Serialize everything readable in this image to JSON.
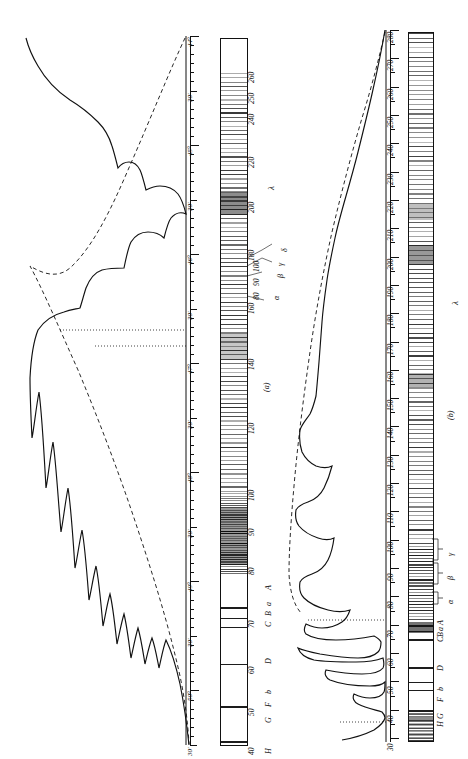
{
  "figure": {
    "caption_a": "(a)",
    "caption_b": "(b)",
    "lambda_symbol_a": "λ",
    "lambda_symbol_b": "λ"
  },
  "panel_a": {
    "name": "panel-a",
    "angular_scale": {
      "unit_major": "°",
      "unit_minor": "'",
      "labels": [
        "44°",
        "30'",
        "45°",
        "30'",
        "46°",
        "30'",
        "47°",
        "30'",
        "48°",
        "30'",
        "49°",
        "30'",
        "50°",
        "30'"
      ],
      "start_deg": 44.0,
      "end_deg": 50.5,
      "minor_tick_interval_min": 5
    },
    "wavelength_scale": {
      "axis_label": "λ",
      "ticks": [
        40,
        50,
        60,
        70,
        80,
        90,
        100,
        120,
        140,
        160,
        180,
        200,
        220,
        240,
        250,
        260
      ]
    },
    "fraunhofer_labels": [
      "H",
      "G",
      "F",
      "b",
      "D",
      "C",
      "B",
      "a",
      "A"
    ],
    "series_labels": [
      "α",
      "β",
      "γ",
      "δ"
    ],
    "lead_values": [
      "80",
      "90",
      "100"
    ]
  },
  "panel_b": {
    "name": "panel-b",
    "wavelength_scale": {
      "axis_label": "λ",
      "ticks": [
        30,
        40,
        50,
        60,
        70,
        80,
        90,
        100,
        110,
        120,
        130,
        140,
        150,
        160,
        170,
        180,
        190,
        200,
        210,
        220,
        230,
        240,
        250,
        260,
        270,
        280
      ],
      "min": 30,
      "max": 280
    },
    "fraunhofer_labels": [
      "H",
      "G",
      "F",
      "b",
      "D",
      "C",
      "B",
      "a",
      "A"
    ],
    "series_labels": [
      "α",
      "β",
      "γ"
    ]
  },
  "chart_data": {
    "type": "line",
    "title": "",
    "xlabel": "λ",
    "ylabel": "Energy",
    "charts": [
      {
        "id": "a",
        "caption": "(a)",
        "xlabel": "λ",
        "xlim": [
          40,
          260
        ],
        "secondary_axis": {
          "name": "deviation angle",
          "min": "44°",
          "max": "50°30'"
        },
        "series": [
          {
            "name": "observed energy curve",
            "style": "solid",
            "x": [
              260,
              250,
              240,
              230,
              220,
              210,
              205,
              200,
              196,
              192,
              188,
              184,
              180,
              176,
              172,
              168,
              164,
              160,
              156,
              152,
              148,
              144,
              140,
              136,
              132,
              128,
              124,
              120,
              116,
              112,
              108,
              104,
              100,
              98,
              96,
              94,
              92,
              90,
              88,
              86,
              84,
              82,
              80,
              78,
              76,
              74,
              72,
              70,
              68,
              66,
              64,
              62,
              60,
              58,
              56,
              54,
              52,
              50,
              48,
              46,
              44,
              42,
              40
            ],
            "y": [
              0.01,
              0.03,
              0.06,
              0.1,
              0.14,
              0.19,
              0.22,
              0.26,
              0.3,
              0.33,
              0.36,
              0.4,
              0.43,
              0.47,
              0.5,
              0.48,
              0.52,
              0.57,
              0.6,
              0.58,
              0.62,
              0.66,
              0.7,
              0.67,
              0.64,
              0.68,
              0.74,
              0.62,
              0.58,
              0.86,
              0.9,
              0.66,
              0.72,
              0.95,
              0.75,
              0.6,
              0.8,
              1.0,
              0.64,
              0.55,
              0.7,
              0.88,
              0.52,
              0.45,
              0.62,
              0.75,
              0.4,
              0.35,
              0.48,
              0.3,
              0.26,
              0.34,
              0.22,
              0.18,
              0.24,
              0.15,
              0.12,
              0.16,
              0.1,
              0.08,
              0.11,
              0.06,
              0.04
            ]
          },
          {
            "name": "envelope (blackbody / ideal)",
            "style": "dashed",
            "x": [
              260,
              240,
              220,
              200,
              180,
              160,
              140,
              120,
              110,
              100,
              95,
              90,
              85,
              80,
              75,
              70,
              65,
              60,
              55,
              50,
              45,
              40
            ],
            "y": [
              0.02,
              0.08,
              0.17,
              0.28,
              0.42,
              0.56,
              0.7,
              0.84,
              0.9,
              0.96,
              0.99,
              1.0,
              0.96,
              0.89,
              0.8,
              0.7,
              0.59,
              0.48,
              0.38,
              0.29,
              0.2,
              0.12
            ]
          }
        ]
      },
      {
        "id": "b",
        "caption": "(b)",
        "xlabel": "λ",
        "xlim": [
          30,
          280
        ],
        "series": [
          {
            "name": "observed energy curve",
            "style": "solid",
            "x": [
              280,
              275,
              270,
              265,
              260,
              255,
              250,
              245,
              240,
              235,
              230,
              225,
              220,
              215,
              210,
              205,
              200,
              195,
              190,
              185,
              180,
              175,
              170,
              165,
              160,
              155,
              150,
              145,
              140,
              136,
              132,
              130,
              128,
              126,
              124,
              122,
              120,
              118,
              116,
              114,
              112,
              110,
              108,
              106,
              104,
              102,
              100,
              98,
              96,
              94,
              92,
              90,
              88,
              86,
              84,
              82,
              80,
              78,
              76,
              74,
              72,
              70,
              68,
              66,
              64,
              62,
              60,
              55,
              50,
              45,
              42,
              40,
              38,
              35,
              32,
              30
            ],
            "y": [
              0.0,
              0.1,
              0.22,
              0.3,
              0.37,
              0.43,
              0.48,
              0.52,
              0.56,
              0.6,
              0.63,
              0.66,
              0.69,
              0.71,
              0.73,
              0.74,
              0.76,
              0.77,
              0.78,
              0.79,
              0.8,
              0.81,
              0.82,
              0.83,
              0.84,
              0.85,
              0.86,
              0.88,
              0.9,
              0.95,
              0.93,
              0.8,
              0.82,
              0.86,
              0.84,
              0.81,
              0.79,
              0.83,
              0.86,
              0.9,
              0.96,
              0.72,
              0.7,
              0.74,
              0.78,
              0.7,
              0.66,
              0.76,
              0.88,
              0.8,
              0.7,
              0.62,
              0.58,
              0.56,
              0.54,
              0.52,
              0.5,
              0.3,
              0.1,
              0.06,
              0.04,
              0.44,
              0.03,
              0.02,
              0.02,
              0.02,
              0.02,
              0.02,
              0.02,
              0.02,
              0.05,
              0.12,
              0.3,
              0.55,
              0.75,
              0.86
            ]
          },
          {
            "name": "envelope (blackbody / ideal)",
            "style": "dashed",
            "x": [
              280,
              260,
              240,
              220,
              200,
              180,
              160,
              150,
              140,
              130,
              120,
              110,
              105,
              100,
              95,
              90,
              85,
              80
            ],
            "y": [
              0.0,
              0.34,
              0.52,
              0.66,
              0.76,
              0.83,
              0.89,
              0.91,
              0.93,
              0.95,
              0.97,
              0.98,
              0.99,
              1.0,
              0.98,
              0.92,
              0.7,
              0.4
            ]
          }
        ]
      }
    ]
  }
}
